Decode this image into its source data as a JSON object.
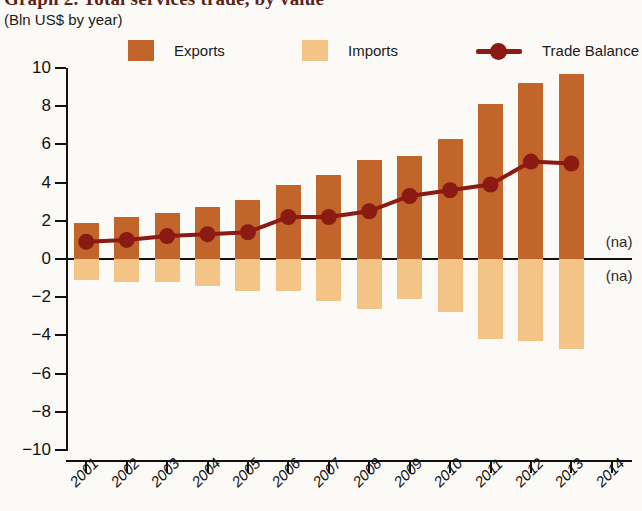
{
  "header": {
    "title": "Graph 2. Total services trade, by value",
    "subtitle": "(Bln US$ by year)"
  },
  "legend": {
    "position": "top",
    "items": [
      {
        "label": "Exports",
        "icon": "square-swatch-icon",
        "color": "#C2652B"
      },
      {
        "label": "Imports",
        "icon": "square-swatch-icon",
        "color": "#F3C486"
      },
      {
        "label": "Trade Balance",
        "icon": "line-marker-icon",
        "color": "#8B1A12"
      }
    ]
  },
  "annotations": [
    {
      "name": "na-exports-2014",
      "text": "(na)"
    },
    {
      "name": "na-imports-2014",
      "text": "(na)"
    }
  ],
  "colors": {
    "exports": "#C2652B",
    "imports": "#F3C486",
    "trade_balance": "#8B1A12",
    "axis": "#111111",
    "background": "#FBFAF7"
  },
  "chart_data": {
    "type": "bar",
    "title": "Graph 2. Total services trade, by value",
    "subtitle": "(Bln US$ by year)",
    "xlabel": "",
    "ylabel": "Bln US$ by year",
    "ylim": [
      -10,
      10
    ],
    "yticks": [
      10,
      8,
      6,
      4,
      2,
      0,
      -2,
      -4,
      -6,
      -8,
      -10
    ],
    "ytick_labels": [
      "10",
      "8",
      "6",
      "4",
      "2",
      "0",
      "−2",
      "−4",
      "−6",
      "−8",
      "−10"
    ],
    "grid": false,
    "legend_position": "top",
    "categories": [
      "2001",
      "2002",
      "2003",
      "2004",
      "2005",
      "2006",
      "2007",
      "2008",
      "2009",
      "2010",
      "2011",
      "2012",
      "2013",
      "2014"
    ],
    "series": [
      {
        "name": "Exports",
        "type": "bar",
        "color": "#C2652B",
        "values": [
          1.9,
          2.2,
          2.4,
          2.7,
          3.1,
          3.9,
          4.4,
          5.2,
          5.4,
          6.3,
          8.1,
          9.2,
          9.7,
          null
        ]
      },
      {
        "name": "Imports",
        "type": "bar",
        "color": "#F3C486",
        "values": [
          -1.1,
          -1.2,
          -1.2,
          -1.4,
          -1.7,
          -1.7,
          -2.2,
          -2.6,
          -2.1,
          -2.8,
          -4.2,
          -4.3,
          -4.7,
          null
        ]
      },
      {
        "name": "Trade Balance",
        "type": "line",
        "color": "#8B1A12",
        "values": [
          0.9,
          1.0,
          1.2,
          1.3,
          1.4,
          2.2,
          2.2,
          2.5,
          3.3,
          3.6,
          3.9,
          5.1,
          5.0,
          null
        ]
      }
    ]
  }
}
